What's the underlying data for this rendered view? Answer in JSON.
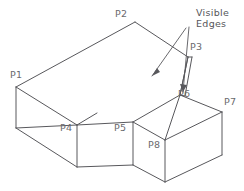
{
  "figure": {
    "background_color": "#ffffff",
    "line_color": "#58585c",
    "label_color": "#6a6a6e",
    "width": 244,
    "height": 191
  },
  "callout": {
    "line1": "Visible",
    "line2": "Edges"
  },
  "vertices": [
    {
      "id": "P1",
      "label": "P1",
      "label_x": 10,
      "label_y": 70,
      "point_x": 16,
      "point_y": 87
    },
    {
      "id": "P2",
      "label": "P2",
      "label_x": 115,
      "label_y": 9,
      "point_x": 135,
      "point_y": 22
    },
    {
      "id": "P3",
      "label": "P3",
      "label_x": 190,
      "label_y": 42,
      "point_x": 188,
      "point_y": 57
    },
    {
      "id": "P4",
      "label": "P4",
      "label_x": 60,
      "label_y": 123,
      "point_x": 77,
      "point_y": 125
    },
    {
      "id": "P5",
      "label": "P5",
      "label_x": 114,
      "label_y": 123,
      "point_x": 133,
      "point_y": 122
    },
    {
      "id": "P6",
      "label": "P6",
      "label_x": 178,
      "label_y": 89,
      "point_x": 180,
      "point_y": 95
    },
    {
      "id": "P7",
      "label": "P7",
      "label_x": 224,
      "label_y": 97,
      "point_x": 222,
      "point_y": 112
    },
    {
      "id": "P8",
      "label": "P8",
      "label_x": 148,
      "label_y": 140,
      "point_x": 165,
      "point_y": 140
    }
  ],
  "geometry": {
    "edges": [
      {
        "name": "top-face-rear-left",
        "d": "M 16 87 L 135 22"
      },
      {
        "name": "top-face-rear-right",
        "d": "M 135 22 L 188 57"
      },
      {
        "name": "top-face-front-right",
        "d": "M 188 57 L 180 95"
      },
      {
        "name": "top-face-front-long",
        "d": "M 180 95 L 133 122"
      },
      {
        "name": "top-face-front-mid",
        "d": "M 133 122 L 77 125"
      },
      {
        "name": "top-face-front-left",
        "d": "M 77 125 L 16 87"
      },
      {
        "name": "left-vertical-front",
        "d": "M 16 87 L 16 128"
      },
      {
        "name": "left-vertical-mid",
        "d": "M 77 125 L 77 167"
      },
      {
        "name": "left-bottom-front",
        "d": "M 16 128 L 77 167"
      },
      {
        "name": "left-inner-diagonal",
        "d": "M 16 128 L 77 125"
      },
      {
        "name": "left-inner-back",
        "d": "M 77 125 L 97 113"
      },
      {
        "name": "mid-vertical-p5",
        "d": "M 133 122 L 133 165"
      },
      {
        "name": "mid-bottom-front",
        "d": "M 77 167 L 133 165"
      },
      {
        "name": "mid-bottom-right",
        "d": "M 133 165 L 165 182"
      },
      {
        "name": "right-vertical-p8",
        "d": "M 165 140 L 165 182"
      },
      {
        "name": "right-top-p5-p6",
        "d": "M 133 122 L 165 140"
      },
      {
        "name": "right-top-p6-p7",
        "d": "M 180 95 L 222 112"
      },
      {
        "name": "right-top-front-p7",
        "d": "M 222 112 L 165 140"
      },
      {
        "name": "right-vertical-p7",
        "d": "M 222 112 L 222 155"
      },
      {
        "name": "right-bottom-edge",
        "d": "M 165 182 L 222 155"
      },
      {
        "name": "narrow-face-left",
        "d": "M 188 57 L 180 95"
      },
      {
        "name": "narrow-face-right",
        "d": "M 192 57 L 185 96"
      },
      {
        "name": "narrow-face-top",
        "d": "M 188 57 L 192 57"
      },
      {
        "name": "narrow-face-bottom",
        "d": "M 180 95 L 185 96"
      },
      {
        "name": "rear-inner-edge",
        "d": "M 165 140 L 180 95"
      }
    ],
    "leaders": [
      {
        "name": "leader-to-top-edge",
        "d": "M 186 28 L 152 76"
      },
      {
        "name": "leader-to-narrow",
        "d": "M 189 27 L 183 92"
      }
    ],
    "arrow_heads": [
      {
        "name": "arrow-top-edge",
        "points": "152,76 160,72 157,68"
      },
      {
        "name": "arrow-narrow",
        "points": "183,92 180,84 187,85"
      }
    ]
  }
}
